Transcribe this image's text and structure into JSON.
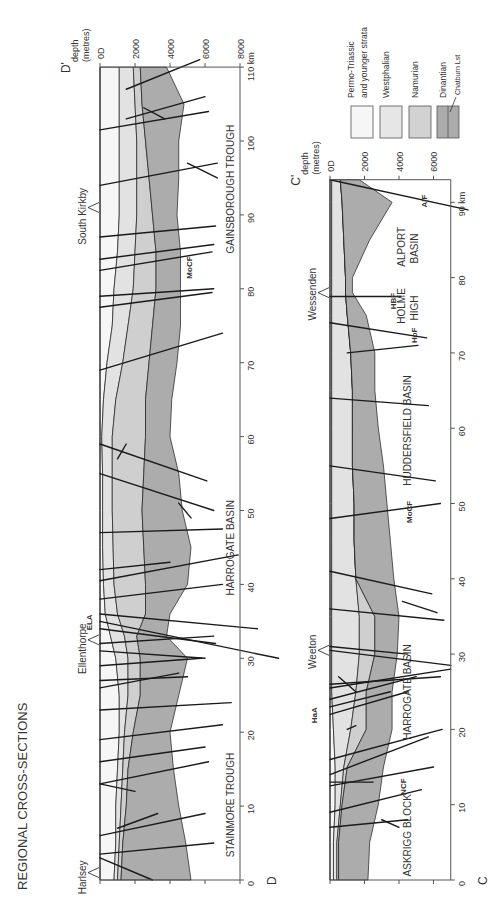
{
  "title": "REGIONAL CROSS-SECTIONS",
  "legend": {
    "items": [
      {
        "label_lines": [
          "Permo-Triassic",
          "and younger strata"
        ],
        "color": "#f6f6f6"
      },
      {
        "label_lines": [
          "Westphalian"
        ],
        "color": "#e6e6e6"
      },
      {
        "label_lines": [
          "Namurian"
        ],
        "color": "#d2d2d2"
      },
      {
        "label_lines": [
          "Dinantian"
        ],
        "color": "#ababab",
        "sub_label": "Chatburn Lst"
      }
    ]
  },
  "colors": {
    "permo_triassic": "#f6f6f6",
    "westphalian": "#e2e2e2",
    "namurian": "#cfcfcf",
    "dinantian": "#acacac",
    "line": "#1a1a1a",
    "axis": "#555555",
    "text": "#333333"
  },
  "sections": [
    {
      "id": "D",
      "start_label": "D",
      "end_label": "D'",
      "depth_axis_title": [
        "depth",
        "(metres)"
      ],
      "depth_ticks": [
        "0D",
        "2000",
        "4000",
        "6000",
        "8000"
      ],
      "depth_tick_values": [
        0,
        2000,
        4000,
        6000,
        8000
      ],
      "km_ticks": [
        "0",
        "10",
        "20",
        "30",
        "40",
        "50",
        "60",
        "70",
        "80",
        "90",
        "100",
        "110 km"
      ],
      "km_tick_values": [
        0,
        10,
        20,
        30,
        40,
        50,
        60,
        70,
        80,
        90,
        100,
        110
      ],
      "length_km": 110,
      "geom": {
        "x0": 100,
        "x8000": 240,
        "y0km": 880,
        "ykm_per": 7.39
      },
      "localities": [
        {
          "name": "Harlsey",
          "km": 1
        },
        {
          "name": "Ellenthorpe",
          "km": 32.5
        },
        {
          "name": "South Kirkby",
          "km": 91
        }
      ],
      "structures": [
        {
          "name": "STAINMORE TROUGH",
          "km": 10
        },
        {
          "name": "HARROGATE BASIN",
          "km": 45
        },
        {
          "name": "GAINSBOROUGH TROUGH",
          "km": 93
        }
      ],
      "fault_labels": [
        {
          "name": "ELA",
          "km": 35,
          "depth": -700
        },
        {
          "name": "MoCF",
          "km": 83,
          "depth": 5000
        }
      ],
      "boundaries": {
        "km": [
          0,
          5,
          10,
          15,
          20,
          25,
          30,
          33,
          36,
          40,
          45,
          50,
          55,
          60,
          65,
          70,
          75,
          80,
          85,
          90,
          95,
          100,
          105,
          110
        ],
        "surface": [
          0,
          0,
          0,
          0,
          0,
          0,
          0,
          0,
          0,
          0,
          0,
          0,
          0,
          0,
          0,
          0,
          0,
          0,
          0,
          0,
          0,
          0,
          0,
          0
        ],
        "base_permo": [
          800,
          900,
          900,
          1000,
          1100,
          1100,
          900,
          600,
          300,
          200,
          150,
          150,
          150,
          100,
          200,
          400,
          700,
          800,
          1000,
          1100,
          1100,
          1100,
          1100,
          1100
        ],
        "base_westphalian": [
          1000,
          1100,
          1200,
          1300,
          1400,
          1600,
          1600,
          1400,
          1000,
          800,
          750,
          700,
          700,
          700,
          900,
          1300,
          1600,
          1900,
          2000,
          2100,
          2100,
          2100,
          2000,
          1900
        ],
        "base_namurian": [
          1200,
          1300,
          1500,
          1600,
          1900,
          2300,
          2300,
          2100,
          2600,
          2600,
          2500,
          2400,
          2500,
          2600,
          2600,
          2800,
          3000,
          3200,
          3200,
          3000,
          2800,
          2600,
          2400,
          2300
        ],
        "base_dinantian": [
          5200,
          4900,
          4500,
          4200,
          4000,
          4500,
          5000,
          3800,
          4000,
          5000,
          5200,
          4700,
          4500,
          4000,
          4100,
          4400,
          4600,
          4600,
          4600,
          4400,
          4500,
          4500,
          4800,
          3800
        ]
      },
      "faults": [
        [
          [
            3,
            0
          ],
          [
            0,
            3000
          ]
        ],
        [
          [
            3.5,
            0
          ],
          [
            5,
            6500
          ]
        ],
        [
          [
            6,
            0
          ],
          [
            9,
            6000
          ]
        ],
        [
          [
            7,
            1000
          ],
          [
            9,
            3300
          ]
        ],
        [
          [
            13,
            0
          ],
          [
            16,
            6200
          ]
        ],
        [
          [
            13,
            0
          ],
          [
            12,
            2000
          ]
        ],
        [
          [
            16,
            0
          ],
          [
            18,
            6000
          ]
        ],
        [
          [
            19,
            0
          ],
          [
            21,
            7000
          ]
        ],
        [
          [
            23,
            0
          ],
          [
            24,
            7500
          ]
        ],
        [
          [
            26,
            0
          ],
          [
            28,
            4500
          ]
        ],
        [
          [
            27,
            0
          ],
          [
            27.5,
            5000
          ]
        ],
        [
          [
            29,
            0
          ],
          [
            30,
            5800
          ]
        ],
        [
          [
            31,
            0
          ],
          [
            30,
            6000
          ]
        ],
        [
          [
            32,
            0
          ],
          [
            33,
            6500
          ]
        ],
        [
          [
            34,
            0
          ],
          [
            32,
            6600
          ]
        ],
        [
          [
            35,
            0
          ],
          [
            30,
            10200
          ]
        ],
        [
          [
            36,
            0
          ],
          [
            34,
            9000
          ]
        ],
        [
          [
            38,
            0
          ],
          [
            40,
            7000
          ]
        ],
        [
          [
            40.5,
            0
          ],
          [
            44,
            7900
          ]
        ],
        [
          [
            42,
            0
          ],
          [
            43,
            4000
          ]
        ],
        [
          [
            47,
            0
          ],
          [
            47.5,
            7000
          ]
        ],
        [
          [
            55,
            0
          ],
          [
            50,
            6500
          ]
        ],
        [
          [
            59,
            0
          ],
          [
            54,
            6100
          ]
        ],
        [
          [
            57,
            1000
          ],
          [
            59,
            1500
          ]
        ],
        [
          [
            51,
            4500
          ],
          [
            49,
            5200
          ]
        ],
        [
          [
            69,
            0
          ],
          [
            74,
            7000
          ]
        ],
        [
          [
            77.5,
            0
          ],
          [
            79.5,
            6400
          ]
        ],
        [
          [
            79,
            0
          ],
          [
            80,
            6500
          ]
        ],
        [
          [
            82.5,
            0
          ],
          [
            85,
            6400
          ]
        ],
        [
          [
            84,
            0
          ],
          [
            86,
            6500
          ]
        ],
        [
          [
            87,
            0
          ],
          [
            88.5,
            6600
          ]
        ],
        [
          [
            94,
            0
          ],
          [
            97,
            6700
          ]
        ],
        [
          [
            97,
            5000
          ],
          [
            95,
            6700
          ]
        ],
        [
          [
            101.5,
            0
          ],
          [
            104,
            6200
          ]
        ],
        [
          [
            104.5,
            2500
          ],
          [
            103,
            3700
          ]
        ],
        [
          [
            103,
            1500
          ],
          [
            106,
            6000
          ]
        ],
        [
          [
            107,
            1500
          ],
          [
            111,
            5700
          ]
        ]
      ]
    },
    {
      "id": "C",
      "start_label": "C",
      "end_label": "C'",
      "depth_axis_title": [
        "depth",
        "(metres)"
      ],
      "depth_ticks": [
        "0D",
        "2000",
        "4000",
        "6000"
      ],
      "depth_tick_values": [
        0,
        2000,
        4000,
        6000
      ],
      "km_ticks": [
        "0",
        "10",
        "20",
        "30",
        "40",
        "50",
        "60",
        "70",
        "80",
        "90 km"
      ],
      "km_tick_values": [
        0,
        10,
        20,
        30,
        40,
        50,
        60,
        70,
        80,
        90
      ],
      "length_km": 93,
      "geom": {
        "x0": 330,
        "x8000": 468,
        "y0km": 880,
        "ykm_per": 7.53
      },
      "localities": [
        {
          "name": "Weeton",
          "km": 30.5
        },
        {
          "name": "Wessenden",
          "km": 78
        }
      ],
      "structures": [
        {
          "name": "ASKRIGG BLOCK",
          "km": 6,
          "lines": 1
        },
        {
          "name": "HARROGATE BASIN",
          "km": 25,
          "lines": 1
        },
        {
          "name": "HUDDERSFIELD BASIN",
          "km": 60,
          "lines": 1
        },
        {
          "name": "HOLME HIGH",
          "km": 76,
          "lines": 2
        },
        {
          "name": "ALPORT BASIN",
          "km": 84,
          "lines": 2
        }
      ],
      "fault_labels": [
        {
          "name": "HaA",
          "km": 22,
          "depth": -1000
        },
        {
          "name": "NCF",
          "km": 12.5,
          "depth": 4200
        },
        {
          "name": "MoCF",
          "km": 49,
          "depth": 4500
        },
        {
          "name": "HoF",
          "km": 72.5,
          "depth": 4800
        },
        {
          "name": "HBF",
          "km": 77,
          "depth": 3600
        },
        {
          "name": "AlF",
          "km": 90.5,
          "depth": 5400
        }
      ],
      "boundaries": {
        "km": [
          0,
          5,
          10,
          15,
          20,
          25,
          30,
          35,
          40,
          45,
          50,
          55,
          60,
          65,
          70,
          75,
          78,
          80,
          85,
          90,
          93
        ],
        "surface": [
          0,
          0,
          0,
          0,
          0,
          0,
          0,
          0,
          0,
          0,
          0,
          0,
          0,
          0,
          0,
          0,
          0,
          0,
          0,
          0,
          0
        ],
        "base_permo": [
          200,
          200,
          300,
          300,
          200,
          100,
          100,
          100,
          100,
          100,
          100,
          100,
          100,
          100,
          100,
          100,
          100,
          100,
          100,
          100,
          100
        ],
        "base_westphalian": [
          400,
          400,
          600,
          800,
          1200,
          1500,
          1700,
          1700,
          1500,
          1400,
          1400,
          1300,
          1300,
          1300,
          1200,
          1000,
          900,
          900,
          800,
          700,
          600
        ],
        "base_namurian": [
          500,
          500,
          700,
          1000,
          2100,
          2100,
          2600,
          2600,
          1500,
          1400,
          1400,
          1300,
          1300,
          1300,
          1200,
          1000,
          900,
          900,
          800,
          700,
          600
        ],
        "base_dinantian": [
          2200,
          2300,
          2800,
          3100,
          3600,
          3600,
          3900,
          4000,
          3700,
          3500,
          3300,
          3100,
          2800,
          2600,
          2600,
          2100,
          1300,
          1300,
          2300,
          3600,
          1700
        ]
      },
      "faults": [
        [
          [
            7,
            0
          ],
          [
            8,
            4500
          ]
        ],
        [
          [
            8,
            3000
          ],
          [
            7,
            4000
          ]
        ],
        [
          [
            9,
            0
          ],
          [
            12,
            5300
          ]
        ],
        [
          [
            12.5,
            0
          ],
          [
            15,
            6000
          ]
        ],
        [
          [
            13,
            0
          ],
          [
            13,
            2500
          ]
        ],
        [
          [
            14,
            0
          ],
          [
            19,
            5700
          ]
        ],
        [
          [
            16,
            0
          ],
          [
            20,
            6500
          ]
        ],
        [
          [
            20,
            1000
          ],
          [
            20.5,
            1500
          ]
        ],
        [
          [
            22,
            0
          ],
          [
            25,
            4500
          ]
        ],
        [
          [
            23,
            0
          ],
          [
            25,
            3500
          ]
        ],
        [
          [
            24,
            0
          ],
          [
            27,
            5000
          ]
        ],
        [
          [
            25.5,
            0
          ],
          [
            28,
            7000
          ]
        ],
        [
          [
            26,
            0
          ],
          [
            27,
            6400
          ]
        ],
        [
          [
            27,
            500
          ],
          [
            25,
            1500
          ]
        ],
        [
          [
            30.5,
            0
          ],
          [
            28.5,
            7000
          ]
        ],
        [
          [
            31,
            0
          ],
          [
            30,
            4500
          ]
        ],
        [
          [
            36,
            0
          ],
          [
            34.5,
            6600
          ]
        ],
        [
          [
            37,
            4200
          ],
          [
            35.5,
            6200
          ]
        ],
        [
          [
            41,
            0
          ],
          [
            38,
            5900
          ]
        ],
        [
          [
            48,
            0
          ],
          [
            50,
            6400
          ]
        ],
        [
          [
            55,
            0
          ],
          [
            53,
            6100
          ]
        ],
        [
          [
            64,
            0
          ],
          [
            63,
            5700
          ]
        ],
        [
          [
            70,
            1000
          ],
          [
            71,
            5100
          ]
        ],
        [
          [
            74,
            0
          ],
          [
            72,
            5600
          ]
        ],
        [
          [
            77.5,
            0
          ],
          [
            77.5,
            4100
          ]
        ],
        [
          [
            93,
            0
          ],
          [
            89,
            8000
          ]
        ]
      ]
    }
  ]
}
